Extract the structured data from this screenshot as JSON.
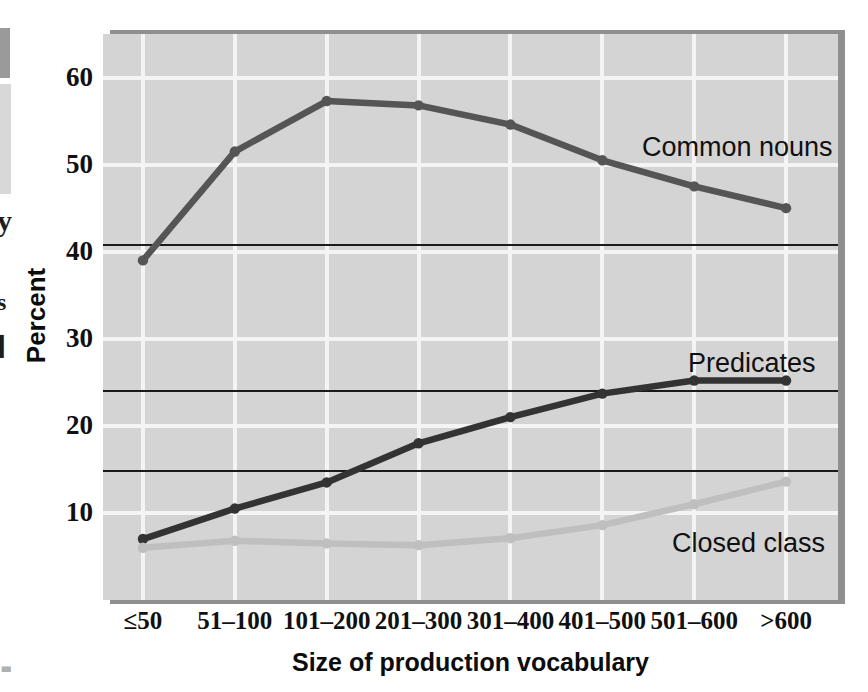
{
  "figure": {
    "y_axis_title": "Percent",
    "x_axis_title": "Size of production vocabulary",
    "y_ticks": [
      "60",
      "50",
      "40",
      "30",
      "20",
      "10"
    ],
    "x_ticks": [
      "≤50",
      "51–100",
      "101–200",
      "201–300",
      "301–400",
      "401–500",
      "501–600",
      ">600"
    ],
    "series_labels": {
      "common_nouns": "Common nouns",
      "predicates": "Predicates",
      "closed_class": "Closed class"
    },
    "colors": {
      "panel_background": "#d4d4d4",
      "gridline": "#f4f4f4",
      "panel_shadow": "#8f8f8f",
      "reference_line": "#1a1a1a",
      "common_nouns": "#555555",
      "predicates": "#333333",
      "closed_class": "#bfbfbf",
      "text": "#101010",
      "page_background": "#ffffff"
    }
  },
  "edge_artifacts": {
    "glyph_1": "y",
    "glyph_2": "s",
    "glyph_3": "▌",
    "glyph_4": "▃"
  },
  "chart_data": {
    "type": "line",
    "title": "",
    "xlabel": "Size of production vocabulary",
    "ylabel": "Percent",
    "categories": [
      "≤50",
      "51–100",
      "101–200",
      "201–300",
      "301–400",
      "401–500",
      "501–600",
      ">600"
    ],
    "ylim": [
      0,
      65
    ],
    "yticks": [
      10,
      20,
      30,
      40,
      50,
      60
    ],
    "grid": true,
    "legend": "inline-annotations",
    "reference_lines": [
      40.8,
      24.0,
      14.8
    ],
    "series": [
      {
        "name": "Common nouns",
        "color": "#555555",
        "values": [
          39.0,
          51.5,
          57.3,
          56.8,
          54.6,
          50.5,
          47.5,
          45.0
        ]
      },
      {
        "name": "Predicates",
        "color": "#333333",
        "values": [
          7.0,
          10.5,
          13.5,
          18.0,
          21.0,
          23.7,
          25.2,
          25.2
        ]
      },
      {
        "name": "Closed class",
        "color": "#bfbfbf",
        "values": [
          6.0,
          6.8,
          6.5,
          6.3,
          7.1,
          8.6,
          11.0,
          13.6
        ]
      }
    ]
  }
}
